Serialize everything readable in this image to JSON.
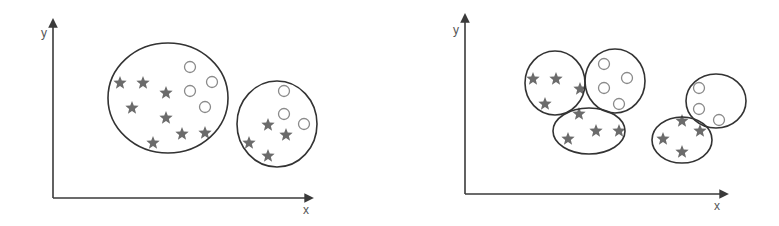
{
  "colors": {
    "axis": "#3a3a3a",
    "cluster_outline": "#333333",
    "star_fill": "#6b6b6b",
    "circle_stroke": "#8a8a8a",
    "background": "#ffffff"
  },
  "icons": {
    "star": "star-icon",
    "circle": "circle-icon",
    "arrow": "arrow-head-icon"
  },
  "panels": [
    {
      "name": "two-clusters",
      "axes": {
        "origin": [
          53,
          198
        ],
        "x_end": 312,
        "y_end": 20,
        "x_label": "x",
        "y_label": "y",
        "x_label_pos": [
          303,
          214
        ],
        "y_label_pos": [
          41,
          37
        ]
      },
      "clusters": [
        {
          "ellipse": {
            "cx": 168,
            "cy": 98,
            "rx": 60,
            "ry": 55
          },
          "stars": [
            [
              120,
              83
            ],
            [
              143,
              83
            ],
            [
              166,
              93
            ],
            [
              132,
              108
            ],
            [
              166,
              118
            ],
            [
              153,
              143
            ],
            [
              182,
              134
            ],
            [
              205,
              133
            ]
          ],
          "circles": [
            [
              190,
              67
            ],
            [
              212,
              82
            ],
            [
              190,
              91
            ],
            [
              205,
              107
            ]
          ]
        },
        {
          "ellipse": {
            "cx": 277,
            "cy": 124,
            "rx": 40,
            "ry": 43
          },
          "stars": [
            [
              268,
              125
            ],
            [
              286,
              135
            ],
            [
              249,
              143
            ],
            [
              268,
              156
            ]
          ],
          "circles": [
            [
              284,
              91
            ],
            [
              284,
              114
            ],
            [
              304,
              124
            ]
          ]
        }
      ]
    },
    {
      "name": "five-clusters",
      "axes": {
        "origin": [
          465,
          194
        ],
        "x_end": 727,
        "y_end": 15,
        "x_label": "x",
        "y_label": "y",
        "x_label_pos": [
          714,
          210
        ],
        "y_label_pos": [
          453,
          34
        ]
      },
      "clusters": [
        {
          "ellipse": {
            "cx": 555,
            "cy": 83,
            "rx": 30,
            "ry": 32
          },
          "stars": [
            [
              533,
              79
            ],
            [
              556,
              79
            ],
            [
              580,
              89
            ],
            [
              545,
              104
            ]
          ],
          "circles": []
        },
        {
          "ellipse": {
            "cx": 615,
            "cy": 81,
            "rx": 30,
            "ry": 32
          },
          "stars": [],
          "circles": [
            [
              604,
              64
            ],
            [
              627,
              78
            ],
            [
              604,
              88
            ],
            [
              619,
              104
            ]
          ]
        },
        {
          "ellipse": {
            "cx": 589,
            "cy": 131,
            "rx": 36,
            "ry": 23
          },
          "stars": [
            [
              579,
              114
            ],
            [
              568,
              139
            ],
            [
              596,
              131
            ],
            [
              619,
              131
            ]
          ],
          "circles": []
        },
        {
          "ellipse": {
            "cx": 716,
            "cy": 101,
            "rx": 30,
            "ry": 27
          },
          "stars": [],
          "circles": [
            [
              699,
              88
            ],
            [
              699,
              109
            ],
            [
              719,
              120
            ]
          ]
        },
        {
          "ellipse": {
            "cx": 682,
            "cy": 140,
            "rx": 30,
            "ry": 23
          },
          "stars": [
            [
              682,
              121
            ],
            [
              700,
              131
            ],
            [
              663,
              139
            ],
            [
              682,
              152
            ]
          ],
          "circles": []
        }
      ]
    }
  ]
}
